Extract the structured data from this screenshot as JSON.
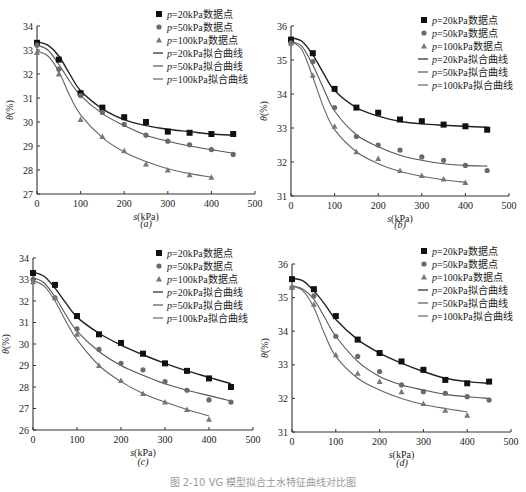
{
  "figure": {
    "caption": "图 2-10  VG 模型拟合土水特征曲线对比图"
  },
  "legend": {
    "items": [
      {
        "label": "p=20kPa数据点",
        "marker": "square",
        "color": "#111111"
      },
      {
        "label": "p=50kPa数据点",
        "marker": "circle",
        "color": "#666666"
      },
      {
        "label": "p=100kPa数据点",
        "marker": "triangle",
        "color": "#777777"
      },
      {
        "label": "p=20kPa拟合曲线",
        "marker": "line",
        "color": "#222222"
      },
      {
        "label": "p=50kPa拟合曲线",
        "marker": "line",
        "color": "#555555"
      },
      {
        "label": "p=100kPa拟合曲线",
        "marker": "line",
        "color": "#666666"
      }
    ]
  },
  "chart_data": [
    {
      "panel": "(a)",
      "type": "scatter",
      "xlabel": "s(kPa)",
      "ylabel": "θ(%)",
      "xlim": [
        0,
        500
      ],
      "ylim": [
        27,
        34
      ],
      "xticks": [
        0,
        100,
        200,
        300,
        400,
        500
      ],
      "yticks": [
        27,
        28,
        29,
        30,
        31,
        32,
        33,
        34
      ],
      "grid": false,
      "legend_position": "upper right",
      "series": [
        {
          "name": "p=20kPa数据点",
          "x": [
            0,
            50,
            100,
            150,
            200,
            250,
            300,
            350,
            400,
            450
          ],
          "y": [
            33.3,
            32.6,
            31.2,
            30.6,
            30.2,
            30.0,
            29.6,
            29.55,
            29.5,
            29.5
          ]
        },
        {
          "name": "p=50kPa数据点",
          "x": [
            0,
            50,
            100,
            150,
            200,
            250,
            300,
            350,
            400,
            450
          ],
          "y": [
            33.2,
            32.2,
            31.1,
            30.4,
            29.9,
            29.45,
            29.2,
            29.05,
            28.85,
            28.65
          ]
        },
        {
          "name": "p=100kPa数据点",
          "x": [
            0,
            50,
            100,
            150,
            200,
            250,
            300,
            350,
            400
          ],
          "y": [
            32.9,
            32.0,
            30.1,
            29.4,
            28.8,
            28.25,
            28.0,
            27.8,
            27.7
          ]
        },
        {
          "name": "p=20kPa拟合曲线",
          "x": [
            0,
            25,
            50,
            75,
            100,
            150,
            200,
            250,
            300,
            350,
            400,
            450
          ],
          "y": [
            33.35,
            33.2,
            32.75,
            32.0,
            31.3,
            30.55,
            30.1,
            29.85,
            29.7,
            29.6,
            29.5,
            29.45
          ]
        },
        {
          "name": "p=50kPa拟合曲线",
          "x": [
            0,
            25,
            50,
            75,
            100,
            150,
            200,
            250,
            300,
            350,
            400,
            450
          ],
          "y": [
            33.2,
            33.0,
            32.4,
            31.7,
            31.1,
            30.35,
            29.85,
            29.45,
            29.2,
            29.0,
            28.85,
            28.7
          ]
        },
        {
          "name": "p=100kPa拟合曲线",
          "x": [
            0,
            25,
            50,
            75,
            100,
            150,
            200,
            250,
            300,
            350,
            400
          ],
          "y": [
            32.95,
            32.75,
            32.1,
            31.1,
            30.3,
            29.35,
            28.75,
            28.35,
            28.05,
            27.85,
            27.7
          ]
        }
      ]
    },
    {
      "panel": "(b)",
      "type": "scatter",
      "xlabel": "s(kPa)",
      "ylabel": "θ(%)",
      "xlim": [
        0,
        500
      ],
      "ylim": [
        31,
        36
      ],
      "xticks": [
        0,
        100,
        200,
        300,
        400,
        500
      ],
      "yticks": [
        31,
        32,
        33,
        34,
        35,
        36
      ],
      "grid": false,
      "legend_position": "upper right",
      "series": [
        {
          "name": "p=20kPa数据点",
          "x": [
            0,
            50,
            100,
            150,
            200,
            250,
            300,
            350,
            400,
            450
          ],
          "y": [
            35.6,
            35.2,
            34.15,
            33.6,
            33.45,
            33.25,
            33.2,
            33.1,
            33.05,
            32.95
          ]
        },
        {
          "name": "p=50kPa数据点",
          "x": [
            0,
            50,
            100,
            150,
            200,
            250,
            300,
            350,
            400,
            450
          ],
          "y": [
            35.5,
            34.95,
            33.6,
            32.75,
            32.5,
            32.35,
            32.15,
            32.05,
            31.9,
            31.75
          ]
        },
        {
          "name": "p=100kPa数据点",
          "x": [
            0,
            50,
            100,
            150,
            200,
            250,
            300,
            350,
            400
          ],
          "y": [
            35.5,
            34.55,
            33.05,
            32.3,
            32.1,
            31.75,
            31.6,
            31.5,
            31.4
          ]
        },
        {
          "name": "p=20kPa拟合曲线",
          "x": [
            0,
            25,
            50,
            75,
            100,
            150,
            200,
            250,
            300,
            350,
            400,
            450
          ],
          "y": [
            35.65,
            35.55,
            35.15,
            34.6,
            34.1,
            33.6,
            33.35,
            33.2,
            33.12,
            33.08,
            33.05,
            33.02
          ]
        },
        {
          "name": "p=50kPa拟合曲线",
          "x": [
            0,
            25,
            50,
            75,
            100,
            150,
            200,
            250,
            300,
            350,
            400,
            450
          ],
          "y": [
            35.55,
            35.4,
            34.85,
            34.15,
            33.5,
            32.8,
            32.45,
            32.2,
            32.05,
            31.95,
            31.9,
            31.88
          ]
        },
        {
          "name": "p=100kPa拟合曲线",
          "x": [
            0,
            25,
            50,
            75,
            100,
            150,
            200,
            250,
            300,
            350,
            400
          ],
          "y": [
            35.55,
            35.3,
            34.5,
            33.6,
            32.95,
            32.3,
            31.95,
            31.72,
            31.58,
            31.48,
            31.4
          ]
        }
      ]
    },
    {
      "panel": "(c)",
      "type": "scatter",
      "xlabel": "s(kPa)",
      "ylabel": "θ(%)",
      "xlim": [
        0,
        500
      ],
      "ylim": [
        26,
        34
      ],
      "xticks": [
        0,
        100,
        200,
        300,
        400,
        500
      ],
      "yticks": [
        26,
        27,
        28,
        29,
        30,
        31,
        32,
        33,
        34
      ],
      "grid": false,
      "legend_position": "upper right",
      "series": [
        {
          "name": "p=20kPa数据点",
          "x": [
            0,
            50,
            100,
            150,
            200,
            250,
            300,
            350,
            400,
            450
          ],
          "y": [
            33.3,
            32.75,
            31.3,
            30.45,
            30.05,
            29.55,
            29.1,
            28.75,
            28.4,
            28.0
          ]
        },
        {
          "name": "p=50kPa数据点",
          "x": [
            0,
            50,
            100,
            150,
            200,
            250,
            300,
            350,
            400,
            450
          ],
          "y": [
            33.0,
            32.15,
            30.7,
            29.75,
            29.1,
            28.8,
            28.25,
            27.85,
            27.4,
            27.3
          ]
        },
        {
          "name": "p=100kPa数据点",
          "x": [
            0,
            50,
            100,
            150,
            200,
            250,
            300,
            350,
            400
          ],
          "y": [
            32.9,
            32.15,
            30.45,
            29.0,
            28.3,
            27.7,
            27.3,
            26.95,
            26.5
          ]
        },
        {
          "name": "p=20kPa拟合曲线",
          "x": [
            0,
            25,
            50,
            75,
            100,
            150,
            200,
            250,
            300,
            350,
            400,
            450
          ],
          "y": [
            33.35,
            33.15,
            32.6,
            31.9,
            31.25,
            30.5,
            29.95,
            29.5,
            29.1,
            28.75,
            28.45,
            28.15
          ]
        },
        {
          "name": "p=50kPa拟合曲线",
          "x": [
            0,
            25,
            50,
            75,
            100,
            150,
            200,
            250,
            300,
            350,
            400,
            450
          ],
          "y": [
            33.1,
            32.85,
            32.2,
            31.35,
            30.6,
            29.65,
            29.0,
            28.55,
            28.15,
            27.85,
            27.6,
            27.35
          ]
        },
        {
          "name": "p=100kPa拟合曲线",
          "x": [
            0,
            25,
            50,
            75,
            100,
            150,
            200,
            250,
            300,
            350,
            400
          ],
          "y": [
            32.95,
            32.7,
            32.0,
            31.05,
            30.2,
            29.0,
            28.25,
            27.7,
            27.3,
            26.95,
            26.65
          ]
        }
      ]
    },
    {
      "panel": "(d)",
      "type": "scatter",
      "xlabel": "s(kPa)",
      "ylabel": "θ(%)",
      "xlim": [
        0,
        500
      ],
      "ylim": [
        31,
        36
      ],
      "xticks": [
        0,
        100,
        200,
        300,
        400,
        500
      ],
      "yticks": [
        31,
        32,
        33,
        34,
        35,
        36
      ],
      "grid": false,
      "legend_position": "upper right",
      "series": [
        {
          "name": "p=20kPa数据点",
          "x": [
            0,
            50,
            100,
            150,
            200,
            250,
            300,
            350,
            400,
            450
          ],
          "y": [
            35.55,
            35.25,
            34.45,
            33.75,
            33.35,
            33.1,
            32.85,
            32.55,
            32.45,
            32.5
          ]
        },
        {
          "name": "p=50kPa数据点",
          "x": [
            0,
            50,
            100,
            150,
            200,
            250,
            300,
            350,
            400,
            450
          ],
          "y": [
            35.3,
            35.05,
            33.85,
            33.25,
            32.8,
            32.4,
            32.2,
            32.15,
            32.05,
            31.95
          ]
        },
        {
          "name": "p=100kPa数据点",
          "x": [
            0,
            50,
            100,
            150,
            200,
            250,
            300,
            350,
            400
          ],
          "y": [
            35.3,
            34.8,
            33.3,
            32.75,
            32.5,
            32.2,
            31.85,
            31.65,
            31.5
          ]
        },
        {
          "name": "p=20kPa拟合曲线",
          "x": [
            0,
            25,
            50,
            75,
            100,
            150,
            200,
            250,
            300,
            350,
            400,
            450
          ],
          "y": [
            35.58,
            35.5,
            35.2,
            34.8,
            34.35,
            33.75,
            33.35,
            33.05,
            32.8,
            32.6,
            32.5,
            32.45
          ]
        },
        {
          "name": "p=50kPa拟合曲线",
          "x": [
            0,
            25,
            50,
            75,
            100,
            150,
            200,
            250,
            300,
            350,
            400,
            450
          ],
          "y": [
            35.35,
            35.25,
            34.95,
            34.4,
            33.85,
            33.1,
            32.65,
            32.4,
            32.25,
            32.12,
            32.05,
            32.0
          ]
        },
        {
          "name": "p=100kPa拟合曲线",
          "x": [
            0,
            25,
            50,
            75,
            100,
            150,
            200,
            250,
            300,
            350,
            400
          ],
          "y": [
            35.35,
            35.2,
            34.7,
            33.9,
            33.25,
            32.6,
            32.25,
            32.0,
            31.82,
            31.7,
            31.6
          ]
        }
      ]
    }
  ]
}
